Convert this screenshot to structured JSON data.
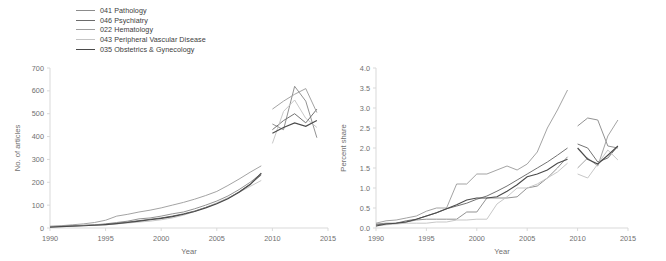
{
  "figure": {
    "legend": {
      "position": "top-left",
      "entries": [
        {
          "label": "041 Pathology",
          "color": "#8c8c8c"
        },
        {
          "label": "046 Psychiatry",
          "color": "#6b6b6b"
        },
        {
          "label": "022 Hematology",
          "color": "#9e9e9e"
        },
        {
          "label": "043 Peripheral Vascular Disease",
          "color": "#c4c4c4"
        },
        {
          "label": "035 Obstetrics & Gynecology",
          "color": "#4a4a4a"
        }
      ]
    }
  },
  "chart_data": [
    {
      "type": "line",
      "title": "",
      "xlabel": "Year",
      "ylabel": "No. of articles",
      "xlim": [
        1990,
        2015
      ],
      "ylim": [
        0,
        700
      ],
      "xticks": [
        1990,
        1995,
        2000,
        2005,
        2010,
        2015
      ],
      "yticks": [
        0,
        100,
        200,
        300,
        400,
        500,
        600,
        700
      ],
      "grid": false,
      "legend_position": "top-left",
      "x": [
        1990,
        1991,
        1992,
        1993,
        1994,
        1995,
        1996,
        1997,
        1998,
        1999,
        2000,
        2001,
        2002,
        2003,
        2004,
        2005,
        2006,
        2007,
        2008,
        2009
      ],
      "x_detached": [
        2010,
        2011,
        2012,
        2013,
        2014
      ],
      "series": [
        {
          "name": "041 Pathology",
          "color": "#8c8c8c",
          "values": [
            6,
            8,
            10,
            12,
            14,
            18,
            24,
            30,
            40,
            44,
            52,
            62,
            70,
            84,
            100,
            118,
            140,
            168,
            200,
            238
          ],
          "values_detached": [
            455,
            430,
            620,
            555,
            395
          ]
        },
        {
          "name": "046 Psychiatry",
          "color": "#6b6b6b",
          "values": [
            5,
            7,
            9,
            11,
            13,
            16,
            20,
            26,
            32,
            38,
            44,
            52,
            62,
            74,
            90,
            108,
            130,
            158,
            192,
            232
          ],
          "values_detached": [
            430,
            470,
            500,
            460,
            520
          ]
        },
        {
          "name": "022 Hematology",
          "color": "#9e9e9e",
          "values": [
            8,
            10,
            14,
            18,
            24,
            34,
            52,
            60,
            70,
            78,
            88,
            100,
            112,
            126,
            142,
            160,
            186,
            214,
            244,
            272
          ],
          "values_detached": [
            520,
            555,
            585,
            610,
            505
          ]
        },
        {
          "name": "043 Peripheral Vascular Disease",
          "color": "#c4c4c4",
          "values": [
            5,
            6,
            8,
            10,
            12,
            14,
            18,
            22,
            26,
            30,
            36,
            44,
            56,
            72,
            90,
            110,
            132,
            156,
            182,
            208
          ],
          "values_detached": [
            370,
            510,
            560,
            480,
            440
          ]
        },
        {
          "name": "035 Obstetrics & Gynecology",
          "color": "#4a4a4a",
          "values": [
            4,
            6,
            8,
            10,
            12,
            15,
            19,
            24,
            30,
            36,
            42,
            50,
            60,
            72,
            88,
            106,
            128,
            156,
            190,
            240
          ],
          "values_detached": [
            415,
            440,
            460,
            445,
            470
          ]
        }
      ]
    },
    {
      "type": "line",
      "title": "",
      "xlabel": "Year",
      "ylabel": "Percent share",
      "xlim": [
        1990,
        2015
      ],
      "ylim": [
        0.0,
        4.0
      ],
      "xticks": [
        1990,
        1995,
        2000,
        2005,
        2010,
        2015
      ],
      "yticks": [
        "0.0",
        "0.5",
        "1.0",
        "1.5",
        "2.0",
        "2.5",
        "3.0",
        "3.5",
        "4.0"
      ],
      "grid": false,
      "legend_position": "top-left",
      "x": [
        1990,
        1991,
        1992,
        1993,
        1994,
        1995,
        1996,
        1997,
        1998,
        1999,
        2000,
        2001,
        2002,
        2003,
        2004,
        2005,
        2006,
        2007,
        2008,
        2009
      ],
      "x_detached": [
        2010,
        2011,
        2012,
        2013,
        2014
      ],
      "series": [
        {
          "name": "041 Pathology",
          "color": "#8c8c8c",
          "values": [
            0.1,
            0.12,
            0.12,
            0.15,
            0.2,
            0.22,
            0.22,
            0.22,
            0.22,
            0.4,
            0.4,
            0.75,
            0.75,
            0.75,
            0.78,
            1.0,
            1.05,
            1.25,
            1.5,
            1.78
          ],
          "values_detached": [
            2.55,
            2.75,
            2.7,
            2.05,
            2.0
          ]
        },
        {
          "name": "046 Psychiatry",
          "color": "#6b6b6b",
          "values": [
            0.08,
            0.1,
            0.12,
            0.18,
            0.22,
            0.3,
            0.38,
            0.48,
            0.55,
            0.62,
            0.72,
            0.8,
            0.92,
            1.05,
            1.2,
            1.35,
            1.5,
            1.65,
            1.82,
            2.0
          ],
          "values_detached": [
            2.1,
            2.0,
            1.65,
            1.75,
            2.05
          ]
        },
        {
          "name": "022 Hematology",
          "color": "#9e9e9e",
          "values": [
            0.12,
            0.18,
            0.2,
            0.25,
            0.3,
            0.42,
            0.5,
            0.5,
            1.1,
            1.1,
            1.35,
            1.35,
            1.45,
            1.55,
            1.45,
            1.6,
            1.9,
            2.5,
            2.95,
            3.45
          ],
          "values_detached": [
            1.5,
            1.75,
            1.55,
            2.3,
            2.7
          ]
        },
        {
          "name": "043 Peripheral Vascular Disease",
          "color": "#c4c4c4",
          "values": [
            0.05,
            0.08,
            0.1,
            0.12,
            0.12,
            0.12,
            0.15,
            0.15,
            0.2,
            0.2,
            0.22,
            0.22,
            0.6,
            0.78,
            1.0,
            1.0,
            1.1,
            1.25,
            1.4,
            1.62
          ],
          "values_detached": [
            1.35,
            1.25,
            1.6,
            1.95,
            1.7
          ]
        },
        {
          "name": "035 Obstetrics & Gynecology",
          "color": "#4a4a4a",
          "values": [
            0.05,
            0.1,
            0.12,
            0.15,
            0.22,
            0.3,
            0.38,
            0.48,
            0.58,
            0.7,
            0.75,
            0.75,
            0.78,
            0.92,
            1.08,
            1.28,
            1.35,
            1.45,
            1.62,
            1.72
          ],
          "values_detached": [
            2.0,
            1.72,
            1.6,
            1.82,
            2.05
          ]
        }
      ]
    }
  ]
}
